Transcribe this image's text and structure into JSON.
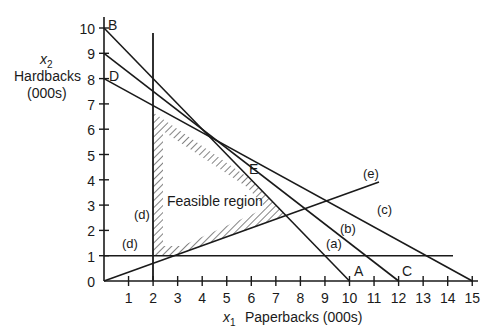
{
  "chart_data": {
    "type": "line",
    "title": "",
    "xlabel": "x1  Paperbacks (000s)",
    "ylabel": "x2 Hardbacks (000s)",
    "xlim": [
      0,
      15
    ],
    "ylim": [
      0,
      10
    ],
    "grid": false,
    "x_ticks": [
      "1",
      "2",
      "3",
      "4",
      "5",
      "6",
      "7",
      "8",
      "9",
      "10",
      "11",
      "12",
      "13",
      "14",
      "15"
    ],
    "y_ticks": [
      "0",
      "1",
      "2",
      "3",
      "4",
      "5",
      "6",
      "7",
      "8",
      "9",
      "10"
    ],
    "series": [
      {
        "name": "(a)",
        "points": [
          [
            0,
            10
          ],
          [
            10,
            0
          ]
        ]
      },
      {
        "name": "(b)",
        "points": [
          [
            0,
            9
          ],
          [
            12,
            0
          ]
        ]
      },
      {
        "name": "(c)",
        "points": [
          [
            0,
            8
          ],
          [
            15,
            0
          ]
        ]
      },
      {
        "name": "(d) vertical",
        "points": [
          [
            2,
            0
          ],
          [
            2,
            9.8
          ]
        ]
      },
      {
        "name": "(d) horizontal",
        "points": [
          [
            0,
            1
          ],
          [
            14.2,
            1
          ]
        ]
      },
      {
        "name": "(e)",
        "points": [
          [
            0,
            0
          ],
          [
            11.2,
            3.9
          ]
        ]
      }
    ],
    "feasible_region": {
      "label": "Feasible region",
      "vertices": [
        [
          2,
          1
        ],
        [
          2,
          6.67
        ],
        [
          6,
          4
        ],
        [
          7.4,
          2.6
        ],
        [
          2.9,
          1
        ]
      ]
    },
    "points": [
      {
        "label": "A",
        "x": 10,
        "y": 0
      },
      {
        "label": "B",
        "x": 0,
        "y": 10
      },
      {
        "label": "C",
        "x": 12,
        "y": 0
      },
      {
        "label": "D",
        "x": 0,
        "y": 8
      },
      {
        "label": "E",
        "x": 6,
        "y": 4
      }
    ]
  },
  "labels": {
    "x_axis_var": "x",
    "x_axis_sub": "1",
    "x_axis_title": "Paperbacks (000s)",
    "y_axis_var": "x",
    "y_axis_sub": "2",
    "y_axis_title_1": "Hardbacks",
    "y_axis_title_2": "(000s)",
    "origin": "0",
    "point_A": "A",
    "point_B": "B",
    "point_C": "C",
    "point_D": "D",
    "point_E": "E",
    "line_a": "(a)",
    "line_b": "(b)",
    "line_c": "(c)",
    "line_d_vertical": "(d)",
    "line_d_horizontal": "(d)",
    "line_e": "(e)",
    "region": "Feasible region"
  },
  "colors": {
    "line": "#1a1a1a",
    "background": "#ffffff"
  }
}
